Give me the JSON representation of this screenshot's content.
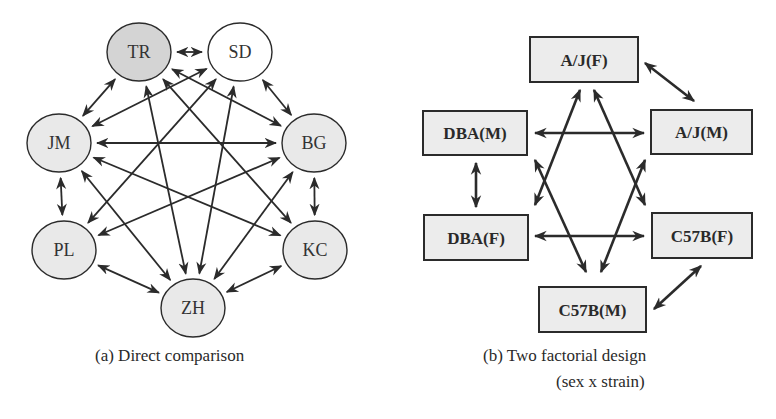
{
  "colors": {
    "stroke": "#2b2b2b",
    "fill_dark": "#d4d4d4",
    "fill_light": "#e9e9e9",
    "fill_white": "#ffffff",
    "box_fill": "#ececec"
  },
  "diagram_a": {
    "caption": "(a)  Direct comparison",
    "nodes": [
      {
        "id": "TR",
        "label": "TR",
        "cx": 139,
        "cy": 52,
        "rx": 32,
        "ry": 29,
        "fill": "fill_dark"
      },
      {
        "id": "SD",
        "label": "SD",
        "cx": 240,
        "cy": 52,
        "rx": 32,
        "ry": 29,
        "fill": "fill_white"
      },
      {
        "id": "JM",
        "label": "JM",
        "cx": 59,
        "cy": 143,
        "rx": 32,
        "ry": 29,
        "fill": "fill_light"
      },
      {
        "id": "BG",
        "label": "BG",
        "cx": 314,
        "cy": 143,
        "rx": 32,
        "ry": 29,
        "fill": "fill_light"
      },
      {
        "id": "PL",
        "label": "PL",
        "cx": 64,
        "cy": 250,
        "rx": 32,
        "ry": 29,
        "fill": "fill_light"
      },
      {
        "id": "KC",
        "label": "KC",
        "cx": 315,
        "cy": 250,
        "rx": 32,
        "ry": 29,
        "fill": "fill_light"
      },
      {
        "id": "ZH",
        "label": "ZH",
        "cx": 193,
        "cy": 308,
        "rx": 32,
        "ry": 29,
        "fill": "fill_light"
      }
    ],
    "edges": [
      [
        "TR",
        "SD"
      ],
      [
        "TR",
        "JM"
      ],
      [
        "TR",
        "BG"
      ],
      [
        "TR",
        "KC"
      ],
      [
        "TR",
        "ZH"
      ],
      [
        "SD",
        "JM"
      ],
      [
        "SD",
        "BG"
      ],
      [
        "SD",
        "PL"
      ],
      [
        "SD",
        "ZH"
      ],
      [
        "JM",
        "BG"
      ],
      [
        "JM",
        "PL"
      ],
      [
        "JM",
        "KC"
      ],
      [
        "JM",
        "ZH"
      ],
      [
        "BG",
        "PL"
      ],
      [
        "BG",
        "KC"
      ],
      [
        "BG",
        "ZH"
      ],
      [
        "PL",
        "ZH"
      ],
      [
        "KC",
        "ZH"
      ]
    ]
  },
  "diagram_b": {
    "caption_line1": "(b)  Two factorial design",
    "caption_line2": "(sex x strain)",
    "boxes": [
      {
        "id": "AJF",
        "label": "A/J(F)",
        "x": 530,
        "y": 37,
        "w": 108,
        "h": 45
      },
      {
        "id": "DBAM",
        "label": "DBA(M)",
        "x": 423,
        "y": 111,
        "w": 104,
        "h": 44
      },
      {
        "id": "AJM",
        "label": "A/J(M)",
        "x": 651,
        "y": 110,
        "w": 101,
        "h": 44
      },
      {
        "id": "DBAF",
        "label": "DBA(F)",
        "x": 424,
        "y": 215,
        "w": 104,
        "h": 45
      },
      {
        "id": "C57BF",
        "label": "C57B(F)",
        "x": 652,
        "y": 213,
        "w": 100,
        "h": 45
      },
      {
        "id": "C57BM",
        "label": "C57B(M)",
        "x": 539,
        "y": 287,
        "w": 107,
        "h": 45
      }
    ],
    "arrows": [
      {
        "from": "AJF",
        "to": "AJM",
        "x1": 645,
        "y1": 63,
        "x2": 694,
        "y2": 101
      },
      {
        "from": "DBAM",
        "to": "AJM",
        "x1": 535,
        "y1": 133,
        "x2": 644,
        "y2": 133
      },
      {
        "from": "DBAM",
        "to": "DBAF",
        "x1": 476,
        "y1": 163,
        "x2": 476,
        "y2": 207
      },
      {
        "from": "DBAF",
        "to": "C57BF",
        "x1": 535,
        "y1": 236,
        "x2": 644,
        "y2": 236
      },
      {
        "from": "C57BF",
        "to": "C57BM",
        "x1": 701,
        "y1": 266,
        "x2": 654,
        "y2": 309
      },
      {
        "from": "AJF",
        "to": "DBAF",
        "x1": 580,
        "y1": 90,
        "x2": 535,
        "y2": 205
      },
      {
        "from": "AJF",
        "to": "C57BF",
        "x1": 594,
        "y1": 90,
        "x2": 645,
        "y2": 205
      },
      {
        "from": "DBAM",
        "to": "C57BM",
        "x1": 535,
        "y1": 160,
        "x2": 586,
        "y2": 272
      },
      {
        "from": "AJM",
        "to": "C57BM",
        "x1": 645,
        "y1": 160,
        "x2": 601,
        "y2": 272
      }
    ]
  }
}
